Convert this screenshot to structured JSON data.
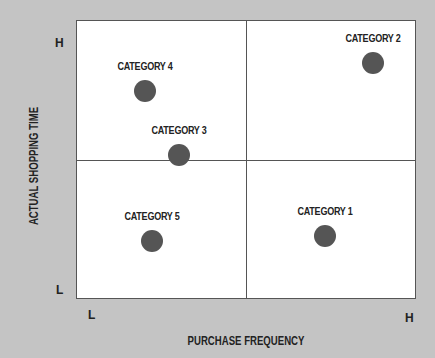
{
  "colors": {
    "background": "#c4c4c4",
    "plot_background": "#ffffff",
    "dot": "#555555",
    "lines": "#555555",
    "text": "#222222"
  },
  "axes": {
    "x_title": "PURCHASE FREQUENCY",
    "y_title": "ACTUAL SHOPPING TIME",
    "x_low": "L",
    "x_high": "H",
    "y_low": "L",
    "y_high": "H"
  },
  "chart_data": {
    "type": "scatter",
    "title": "",
    "xlabel": "PURCHASE FREQUENCY",
    "ylabel": "ACTUAL SHOPPING TIME",
    "xlim": [
      0,
      10
    ],
    "ylim": [
      0,
      10
    ],
    "x_tick_labels": [
      "L",
      "H"
    ],
    "y_tick_labels": [
      "L",
      "H"
    ],
    "quadrant_dividers": {
      "x": 5,
      "y": 5
    },
    "grid": false,
    "legend": "none",
    "points": [
      {
        "label": "CATEGORY 1",
        "x": 7.3,
        "y": 2.3
      },
      {
        "label": "CATEGORY 2",
        "x": 8.7,
        "y": 8.5
      },
      {
        "label": "CATEGORY 3",
        "x": 3.0,
        "y": 5.2
      },
      {
        "label": "CATEGORY 4",
        "x": 2.0,
        "y": 7.5
      },
      {
        "label": "CATEGORY 5",
        "x": 2.2,
        "y": 2.1
      }
    ]
  }
}
